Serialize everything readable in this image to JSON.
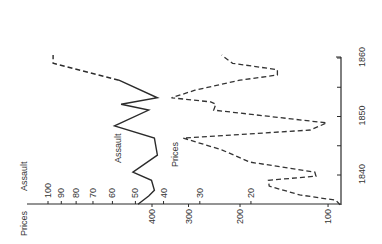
{
  "chart_data": {
    "type": "line",
    "orientation_note": "figure rotated 90 degrees counter-clockwise; time axis appears vertical on right, value axes appear horizontal at bottom",
    "title": "",
    "xlabel": "",
    "ylabel_left": "Prices",
    "ylabel_right": "Assault",
    "x_ticks": [
      1840,
      1850,
      1860
    ],
    "x_minor_ticks": [
      1845,
      1855
    ],
    "xlim": [
      1835,
      1860.5
    ],
    "axes": {
      "prices": {
        "label": "Prices",
        "scale": "log",
        "ticks": [
          100,
          200,
          300,
          400
        ]
      },
      "assault": {
        "label": "Assault",
        "scale": "log",
        "ticks": [
          20,
          30,
          40,
          50,
          60,
          70,
          80,
          90,
          100
        ]
      }
    },
    "series": [
      {
        "name": "Assault",
        "style": "solid (dashed after 1856)",
        "axis": "assault",
        "x": [
          1835.0,
          1836.4,
          1837.4,
          1839.1,
          1840.5,
          1843.4,
          1846.3,
          1848.4,
          1851.1,
          1852.1,
          1853.2,
          1856.2,
          1859.1,
          1860.5
        ],
        "values": [
          49,
          45,
          43,
          44,
          51,
          42,
          43,
          59,
          45,
          56,
          42,
          57,
          96,
          96
        ],
        "dashed_from_index": 11
      },
      {
        "name": "Prices",
        "style": "dashed",
        "axis": "prices",
        "x": [
          1834.9,
          1835.7,
          1836.6,
          1838.1,
          1839.1,
          1839.8,
          1840.5,
          1842.2,
          1844.3,
          1846.3,
          1847.7,
          1848.9,
          1851.1,
          1852.1,
          1852.5,
          1853.2,
          1854.5,
          1856.2,
          1857.1,
          1858.0,
          1859.1,
          1860.5
        ],
        "values": [
          91,
          94,
          125,
          159,
          160,
          110,
          111,
          185,
          231,
          313,
          115,
          101,
          246,
          242,
          252,
          343,
          285,
          200,
          149,
          149,
          212,
          231
        ]
      }
    ],
    "annotations": [
      {
        "text": "Assault",
        "near_series": "Assault"
      },
      {
        "text": "Prices",
        "near_series": "Prices"
      }
    ],
    "grid": false,
    "legend": "none (inline labels)"
  },
  "labels": {
    "prices_axis": "Prices",
    "assault_axis": "Assault",
    "assault_series": "Assault",
    "prices_series": "Prices"
  }
}
